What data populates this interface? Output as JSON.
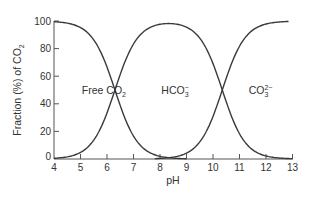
{
  "chart_data": {
    "type": "line",
    "title": "",
    "xlabel": "pH",
    "ylabel": "Fraction (%) of CO2",
    "ylabel_parts": {
      "main": "Fraction (%) of CO",
      "sub": "2"
    },
    "xlim": [
      4,
      13
    ],
    "ylim": [
      0,
      100
    ],
    "x_ticks": [
      4,
      5,
      6,
      7,
      8,
      9,
      10,
      11,
      12,
      13
    ],
    "y_ticks": [
      0,
      20,
      40,
      60,
      80,
      100
    ],
    "grid": false,
    "legend": "none",
    "x": [
      4,
      4.5,
      5,
      5.5,
      6,
      6.5,
      7,
      7.5,
      8,
      8.5,
      9,
      9.5,
      10,
      10.5,
      11,
      11.5,
      12,
      12.5,
      13
    ],
    "series": [
      {
        "name": "Free CO2",
        "values": [
          99.5,
          98.4,
          95.2,
          86.3,
          66.6,
          38.7,
          16.6,
          5.9,
          1.9,
          0.6,
          0.2,
          0.1,
          0,
          0,
          0,
          0,
          0,
          0,
          0
        ]
      },
      {
        "name": "HCO3-",
        "values": [
          0.5,
          1.6,
          4.8,
          13.7,
          33.4,
          61.3,
          83.4,
          94.0,
          97.6,
          98.0,
          95.5,
          87.6,
          69.1,
          41.4,
          18.3,
          6.6,
          2.2,
          0.7,
          0.2
        ]
      },
      {
        "name": "CO3 2-",
        "values": [
          0,
          0,
          0,
          0,
          0,
          0,
          0,
          0.1,
          0.4,
          1.4,
          4.3,
          12.4,
          30.9,
          58.6,
          81.7,
          93.4,
          97.8,
          99.3,
          99.8
        ]
      }
    ],
    "annotations": [
      {
        "main": "Free CO",
        "sub": "2",
        "sup": "",
        "x_ph": 5.05,
        "y_pct": 50
      },
      {
        "main": "HCO",
        "sub": "3",
        "sup": "−",
        "x_ph": 8.05,
        "y_pct": 50
      },
      {
        "main": "CO",
        "sub": "3",
        "sup": "2−",
        "x_ph": 11.35,
        "y_pct": 50
      }
    ],
    "pKa": [
      6.3,
      10.35
    ],
    "line_color": "#3a3a3a",
    "axis_color": "#555555"
  }
}
